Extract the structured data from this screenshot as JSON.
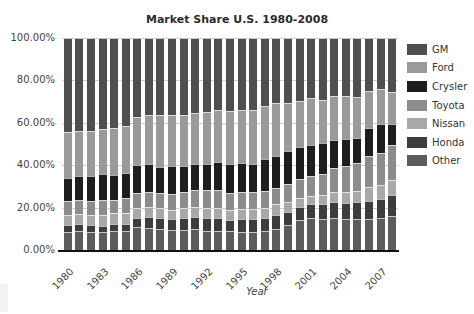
{
  "chart_data": {
    "type": "bar",
    "stacked": true,
    "title": "Market Share U.S. 1980-2008",
    "xlabel": "Year",
    "ylabel": "",
    "ylim": [
      0,
      100
    ],
    "y_ticks": [
      "0.00%",
      "20.00%",
      "40.00%",
      "60.00%",
      "80.00%",
      "100.00%"
    ],
    "x_tick_labels": [
      "1980",
      "1983",
      "1986",
      "1989",
      "1992",
      "1995",
      "1998",
      "2001",
      "2004",
      "2007"
    ],
    "grid": true,
    "legend_position": "right",
    "categories": [
      "1980",
      "1981",
      "1982",
      "1983",
      "1984",
      "1985",
      "1986",
      "1987",
      "1988",
      "1989",
      "1990",
      "1991",
      "1992",
      "1993",
      "1994",
      "1995",
      "1996",
      "1997",
      "1998",
      "1999",
      "2000",
      "2001",
      "2002",
      "2003",
      "2004",
      "2005",
      "2006",
      "2007",
      "2008"
    ],
    "series": [
      {
        "name": "Other",
        "color": "#5c5c5c",
        "values": [
          8.5,
          9,
          8.5,
          8.5,
          9,
          9,
          11,
          10.5,
          10,
          9.5,
          9.5,
          10,
          9,
          9,
          9,
          8.5,
          8.5,
          9,
          10,
          12,
          14,
          15,
          14.5,
          15,
          14.5,
          14.5,
          14.5,
          15,
          16
        ]
      },
      {
        "name": "Honda",
        "color": "#3d3d3d",
        "values": [
          3.5,
          3.5,
          3.5,
          3,
          3.5,
          3.5,
          4,
          5,
          5,
          5,
          5.5,
          5.5,
          6,
          6,
          5,
          6,
          6,
          6,
          6.5,
          6,
          6.5,
          6.5,
          7,
          7.5,
          7.5,
          8,
          8.5,
          9,
          10
        ]
      },
      {
        "name": "Nissan",
        "color": "#a8a8a8",
        "values": [
          4.5,
          4.5,
          4.5,
          5,
          5,
          5,
          5,
          5,
          5,
          4.5,
          5,
          5,
          5,
          5,
          5,
          5,
          5,
          5,
          5,
          4.5,
          4,
          4,
          4.5,
          5,
          5.5,
          5.5,
          6.5,
          6.5,
          7
        ]
      },
      {
        "name": "Toyota",
        "color": "#8c8c8c",
        "values": [
          6.5,
          6.5,
          6.5,
          7,
          6,
          7,
          7,
          7,
          7,
          7.5,
          7.5,
          8,
          8.5,
          8.5,
          8,
          8,
          8,
          8,
          8,
          8.5,
          9,
          9.5,
          10,
          11,
          12,
          13,
          15,
          15.5,
          16.5
        ]
      },
      {
        "name": "Crysler",
        "color": "#1e1e1e",
        "values": [
          11,
          11.5,
          12,
          12.5,
          12,
          12,
          13,
          13,
          12,
          13,
          12,
          12,
          12,
          13,
          13.5,
          13.5,
          13,
          15,
          15,
          15.5,
          15,
          14.5,
          14.5,
          13.5,
          13,
          12,
          13,
          13.5,
          10
        ]
      },
      {
        "name": "Ford",
        "color": "#9a9a9a",
        "values": [
          21.5,
          21,
          21,
          21,
          22,
          22,
          23,
          23,
          24.5,
          24,
          24,
          24,
          24.5,
          24.5,
          25,
          25,
          25.5,
          25,
          25,
          23,
          22,
          22,
          20.5,
          20.5,
          20,
          19,
          17.5,
          16.5,
          15
        ]
      },
      {
        "name": "GM",
        "color": "#4f4f4f",
        "values": [
          44.5,
          44,
          44,
          43,
          42.5,
          41.5,
          37,
          36.5,
          36.5,
          36.5,
          36.5,
          35.5,
          35,
          34,
          34.5,
          34,
          34,
          32,
          30.5,
          30.5,
          29.5,
          28.5,
          29,
          27.5,
          27.5,
          28,
          25,
          24,
          25.5
        ]
      }
    ]
  },
  "legend": {
    "items": [
      {
        "label": "GM",
        "color": "#4f4f4f"
      },
      {
        "label": "Ford",
        "color": "#9a9a9a"
      },
      {
        "label": "Crysler",
        "color": "#1e1e1e"
      },
      {
        "label": "Toyota",
        "color": "#8c8c8c"
      },
      {
        "label": "Nissan",
        "color": "#a8a8a8"
      },
      {
        "label": "Honda",
        "color": "#3d3d3d"
      },
      {
        "label": "Other",
        "color": "#5c5c5c"
      }
    ]
  }
}
